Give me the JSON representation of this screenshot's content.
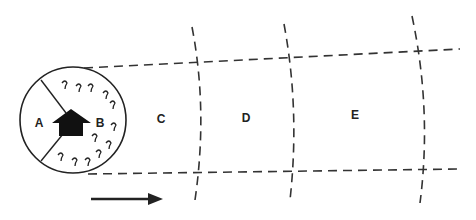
{
  "diagram": {
    "labels": {
      "A": "A",
      "B": "B",
      "C": "C",
      "D": "D",
      "E": "E"
    },
    "colors": {
      "line": "#222222",
      "dash": "#333333",
      "background": "#ffffff"
    }
  }
}
